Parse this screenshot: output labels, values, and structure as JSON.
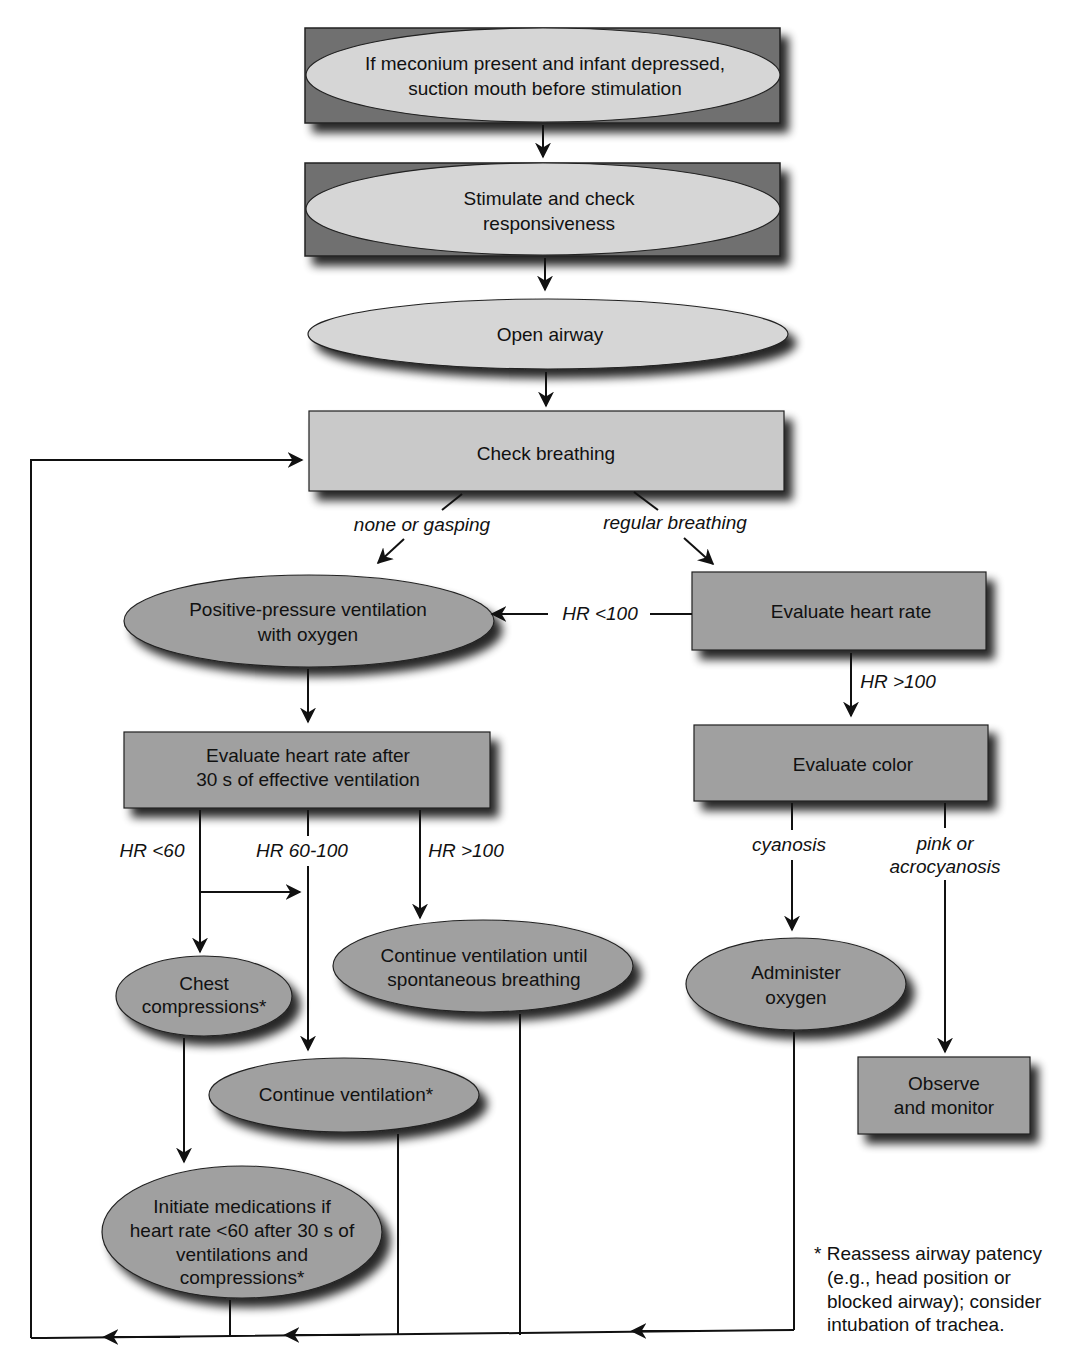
{
  "colors": {
    "frame_dark": "#6e6e6e",
    "light_fill": "#d4d4d4",
    "dark_fill": "#9a9a9a",
    "stroke": "#222222"
  },
  "nodes": {
    "meconium": {
      "lines": [
        "If meconium present and infant depressed,",
        "suction mouth before stimulation"
      ]
    },
    "stimulate": {
      "lines": [
        "Stimulate and check",
        "responsiveness"
      ]
    },
    "open_airway": {
      "lines": [
        "Open airway"
      ]
    },
    "check_breathing": {
      "lines": [
        "Check breathing"
      ]
    },
    "ppv": {
      "lines": [
        "Positive-pressure ventilation",
        "with oxygen"
      ]
    },
    "eval_hr": {
      "lines": [
        "Evaluate heart rate"
      ]
    },
    "eval_hr_after": {
      "lines": [
        "Evaluate heart rate after",
        "30 s of effective ventilation"
      ]
    },
    "eval_color": {
      "lines": [
        "Evaluate color"
      ]
    },
    "chest_compressions": {
      "lines": [
        "Chest",
        "compressions*"
      ]
    },
    "continue_until": {
      "lines": [
        "Continue ventilation until",
        "spontaneous breathing"
      ]
    },
    "administer_oxygen": {
      "lines": [
        "Administer",
        "oxygen"
      ]
    },
    "continue_ventilation": {
      "lines": [
        "Continue ventilation*"
      ]
    },
    "observe": {
      "lines": [
        "Observe",
        "and monitor"
      ]
    },
    "medications": {
      "lines": [
        "Initiate medications if",
        "heart rate <60 after 30 s of",
        "ventilations and",
        "compressions*"
      ]
    }
  },
  "edge_labels": {
    "none_gasping": "none or gasping",
    "regular_breathing": "regular breathing",
    "hr_lt_100": "HR <100",
    "hr_gt_100_right": "HR >100",
    "hr_lt_60": "HR <60",
    "hr_60_100": "HR 60-100",
    "hr_gt_100_left": "HR >100",
    "cyanosis": "cyanosis",
    "pink_lines": [
      "pink or",
      "acrocyanosis"
    ]
  },
  "footnote": {
    "lines": [
      "* Reassess airway patency",
      "(e.g., head position or",
      "blocked airway); consider",
      "intubation of trachea."
    ]
  }
}
